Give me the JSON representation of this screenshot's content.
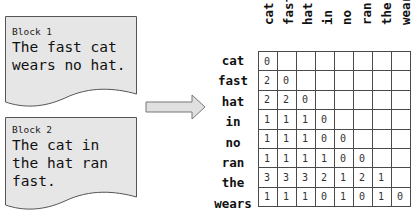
{
  "blocks": [
    {
      "label": "Block 1",
      "text": "The fast cat\nwears no hat."
    },
    {
      "label": "Block 2",
      "text": "The cat in\nthe hat ran\nfast."
    }
  ],
  "arrow": {
    "icon": "right-arrow-icon",
    "color": "#e0e0e0"
  },
  "matrix": {
    "columns": [
      "cat",
      "fast",
      "hat",
      "in",
      "no",
      "ran",
      "the",
      "wears"
    ],
    "rows": [
      {
        "label": "cat",
        "values": [
          "0",
          "",
          "",
          "",
          "",
          "",
          "",
          ""
        ]
      },
      {
        "label": "fast",
        "values": [
          "2",
          "0",
          "",
          "",
          "",
          "",
          "",
          ""
        ]
      },
      {
        "label": "hat",
        "values": [
          "2",
          "2",
          "0",
          "",
          "",
          "",
          "",
          ""
        ]
      },
      {
        "label": "in",
        "values": [
          "1",
          "1",
          "1",
          "0",
          "",
          "",
          "",
          ""
        ]
      },
      {
        "label": "no",
        "values": [
          "1",
          "1",
          "1",
          "0",
          "0",
          "",
          "",
          ""
        ]
      },
      {
        "label": "ran",
        "values": [
          "1",
          "1",
          "1",
          "1",
          "0",
          "0",
          "",
          ""
        ]
      },
      {
        "label": "the",
        "values": [
          "3",
          "3",
          "3",
          "2",
          "1",
          "2",
          "1",
          ""
        ]
      },
      {
        "label": "wears",
        "values": [
          "1",
          "1",
          "1",
          "0",
          "1",
          "0",
          "1",
          "0"
        ]
      }
    ]
  },
  "colors": {
    "block_fill": "#e6e6e6",
    "block_border": "#555555",
    "grid_line": "#4a4a4a"
  }
}
